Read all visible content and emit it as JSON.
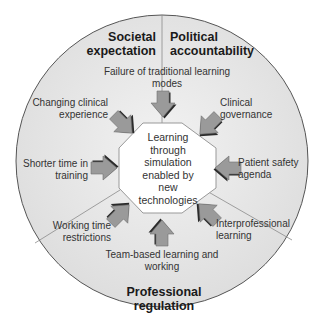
{
  "diagram": {
    "center": {
      "label": "Learning\nthrough\nsimulation\nenabled by\nnew\ntechnologies"
    },
    "sectors": [
      {
        "id": "societal",
        "label": "Societal\nexpectation"
      },
      {
        "id": "political",
        "label": "Political\naccountability"
      },
      {
        "id": "professional",
        "label": "Professional\nregulation"
      }
    ],
    "drivers": [
      {
        "label": "Failure of traditional learning\nmodes",
        "arrow_direction": "down"
      },
      {
        "label": "Clinical\ngovernance",
        "arrow_direction": "down-left"
      },
      {
        "label": "Patient safety\nagenda",
        "arrow_direction": "left"
      },
      {
        "label": "Interprofessional\nlearning",
        "arrow_direction": "up-left"
      },
      {
        "label": "Team-based learning and\nworking",
        "arrow_direction": "up"
      },
      {
        "label": "Working time\nrestrictions",
        "arrow_direction": "up-right"
      },
      {
        "label": "Shorter time in\ntraining",
        "arrow_direction": "right"
      },
      {
        "label": "Changing clinical\nexperience",
        "arrow_direction": "down-right"
      }
    ],
    "colors": {
      "circle_fill": "#e2e2e2",
      "circle_stroke": "#555555",
      "octagon_fill": "#ffffff",
      "octagon_stroke": "#999999",
      "arrow_fill": "#9a9a9a",
      "arrow_shadow": "#2a2a2a",
      "divider": "#8a8a8a"
    }
  }
}
